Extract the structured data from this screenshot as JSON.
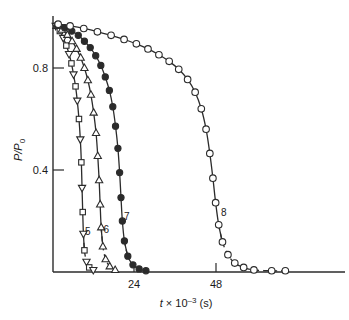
{
  "chart_data": {
    "type": "line",
    "title": "",
    "xlabel": "t × 10⁻³ (s)",
    "ylabel": "P/P₀",
    "xlim": [
      0,
      72
    ],
    "ylim": [
      0,
      1.0
    ],
    "xticks": [
      24,
      48
    ],
    "xtick_labels": [
      "24",
      "48"
    ],
    "yticks": [
      0.4,
      0.8
    ],
    "ytick_labels": [
      "0.4",
      "0.8"
    ],
    "grid": false,
    "legend_position": "inline-curve-labels",
    "series": [
      {
        "name": "5",
        "label": "5",
        "marker": "square-and-down-triangle",
        "marker_fill": "open",
        "line_style": "solid-with-dashed-tail",
        "points": [
          {
            "x": 0.8,
            "y": 0.965
          },
          {
            "x": 2.0,
            "y": 0.945
          },
          {
            "x": 3.0,
            "y": 0.918
          },
          {
            "x": 3.9,
            "y": 0.888
          },
          {
            "x": 4.7,
            "y": 0.855
          },
          {
            "x": 5.4,
            "y": 0.818
          },
          {
            "x": 6.0,
            "y": 0.775
          },
          {
            "x": 6.6,
            "y": 0.728
          },
          {
            "x": 7.1,
            "y": 0.672
          },
          {
            "x": 7.6,
            "y": 0.6
          },
          {
            "x": 8.0,
            "y": 0.52
          },
          {
            "x": 8.3,
            "y": 0.43
          },
          {
            "x": 8.5,
            "y": 0.33
          },
          {
            "x": 8.7,
            "y": 0.235
          },
          {
            "x": 8.9,
            "y": 0.15
          },
          {
            "x": 9.2,
            "y": 0.085
          },
          {
            "x": 9.8,
            "y": 0.04
          },
          {
            "x": 10.6,
            "y": 0.018
          },
          {
            "x": 11.8,
            "y": 0.008
          }
        ]
      },
      {
        "name": "6",
        "label": "6",
        "marker": "up-triangle",
        "marker_fill": "open",
        "line_style": "solid-with-dashed-tail",
        "points": [
          {
            "x": 1.0,
            "y": 0.965
          },
          {
            "x": 2.6,
            "y": 0.95
          },
          {
            "x": 4.2,
            "y": 0.93
          },
          {
            "x": 5.6,
            "y": 0.905
          },
          {
            "x": 6.9,
            "y": 0.875
          },
          {
            "x": 8.1,
            "y": 0.84
          },
          {
            "x": 9.2,
            "y": 0.8
          },
          {
            "x": 10.2,
            "y": 0.752
          },
          {
            "x": 11.1,
            "y": 0.695
          },
          {
            "x": 11.9,
            "y": 0.625
          },
          {
            "x": 12.6,
            "y": 0.545
          },
          {
            "x": 13.1,
            "y": 0.455
          },
          {
            "x": 13.5,
            "y": 0.36
          },
          {
            "x": 13.8,
            "y": 0.265
          },
          {
            "x": 14.1,
            "y": 0.175
          },
          {
            "x": 14.6,
            "y": 0.1
          },
          {
            "x": 15.4,
            "y": 0.05
          },
          {
            "x": 16.6,
            "y": 0.022
          },
          {
            "x": 18.2,
            "y": 0.008
          }
        ]
      },
      {
        "name": "7",
        "label": "7",
        "marker": "circle",
        "marker_fill": "filled",
        "line_style": "solid-with-dashed-tail",
        "points": [
          {
            "x": 1.2,
            "y": 0.968
          },
          {
            "x": 3.4,
            "y": 0.958
          },
          {
            "x": 5.5,
            "y": 0.945
          },
          {
            "x": 7.4,
            "y": 0.928
          },
          {
            "x": 9.2,
            "y": 0.905
          },
          {
            "x": 10.9,
            "y": 0.88
          },
          {
            "x": 12.5,
            "y": 0.848
          },
          {
            "x": 14.0,
            "y": 0.81
          },
          {
            "x": 15.3,
            "y": 0.765
          },
          {
            "x": 16.5,
            "y": 0.712
          },
          {
            "x": 17.5,
            "y": 0.648
          },
          {
            "x": 18.3,
            "y": 0.572
          },
          {
            "x": 19.0,
            "y": 0.485
          },
          {
            "x": 19.5,
            "y": 0.39
          },
          {
            "x": 19.9,
            "y": 0.292
          },
          {
            "x": 20.3,
            "y": 0.2
          },
          {
            "x": 20.9,
            "y": 0.122
          },
          {
            "x": 21.9,
            "y": 0.062
          },
          {
            "x": 23.4,
            "y": 0.028
          },
          {
            "x": 25.2,
            "y": 0.012
          },
          {
            "x": 27.2,
            "y": 0.005
          }
        ]
      },
      {
        "name": "8",
        "label": "8",
        "marker": "circle",
        "marker_fill": "open",
        "line_style": "solid-with-dashed-tail",
        "points": [
          {
            "x": 1.5,
            "y": 0.972
          },
          {
            "x": 5.0,
            "y": 0.965
          },
          {
            "x": 9.0,
            "y": 0.955
          },
          {
            "x": 13.0,
            "y": 0.942
          },
          {
            "x": 17.0,
            "y": 0.928
          },
          {
            "x": 20.8,
            "y": 0.912
          },
          {
            "x": 24.4,
            "y": 0.895
          },
          {
            "x": 27.8,
            "y": 0.875
          },
          {
            "x": 31.0,
            "y": 0.852
          },
          {
            "x": 34.0,
            "y": 0.826
          },
          {
            "x": 36.8,
            "y": 0.795
          },
          {
            "x": 39.4,
            "y": 0.755
          },
          {
            "x": 41.6,
            "y": 0.705
          },
          {
            "x": 43.4,
            "y": 0.64
          },
          {
            "x": 44.8,
            "y": 0.56
          },
          {
            "x": 45.9,
            "y": 0.465
          },
          {
            "x": 46.8,
            "y": 0.368
          },
          {
            "x": 47.6,
            "y": 0.272
          },
          {
            "x": 48.5,
            "y": 0.185
          },
          {
            "x": 49.6,
            "y": 0.118
          },
          {
            "x": 51.2,
            "y": 0.068
          },
          {
            "x": 53.2,
            "y": 0.035
          },
          {
            "x": 55.8,
            "y": 0.018
          },
          {
            "x": 58.8,
            "y": 0.008
          },
          {
            "x": 64.0,
            "y": 0.005
          },
          {
            "x": 68.0,
            "y": 0.005
          }
        ]
      }
    ],
    "curve_label_positions": [
      {
        "label": "5",
        "x": 10.2,
        "y": 0.145
      },
      {
        "label": "6",
        "x": 15.6,
        "y": 0.152
      },
      {
        "label": "7",
        "x": 21.6,
        "y": 0.205
      },
      {
        "label": "8",
        "x": 50.0,
        "y": 0.218
      }
    ]
  },
  "axes": {
    "y_label_text": "P/P",
    "y_label_sub": "0",
    "x_label_var": "t",
    "x_label_mul": "× 10",
    "x_label_exp": "–3",
    "x_label_unit": "(s)"
  }
}
